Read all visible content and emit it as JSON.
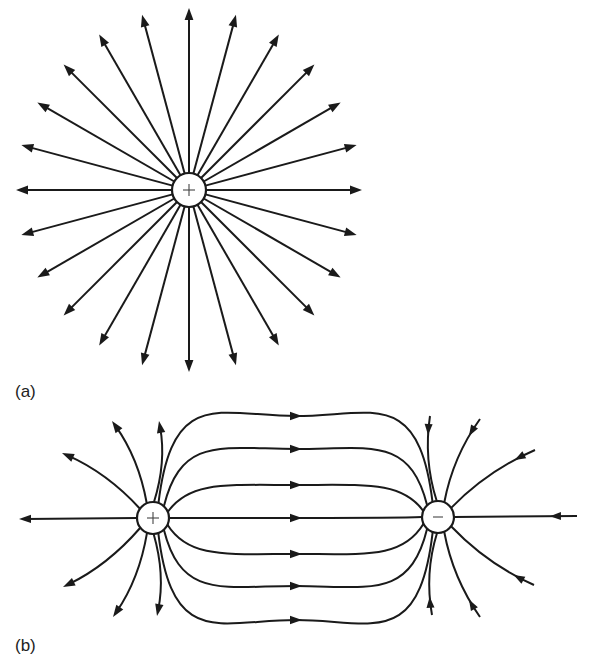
{
  "figure": {
    "background": "#ffffff",
    "stroke_color": "#1a1a1a",
    "panels": [
      {
        "id": "a",
        "label": "(a)",
        "title": "Field lines of an isolated positive point charge",
        "charge": {
          "sign": "+",
          "symbol": "+",
          "cx": 189,
          "cy": 190,
          "r": 17
        },
        "field_lines": {
          "count": 24,
          "direction": "outward",
          "extent_x": 173,
          "extent_y": 182
        }
      },
      {
        "id": "b",
        "label": "(b)",
        "title": "Field lines of an electric dipole (positive and negative charge)",
        "positive_charge": {
          "sign": "+",
          "symbol": "+",
          "cx": 153,
          "cy": 518,
          "r": 16
        },
        "negative_charge": {
          "sign": "-",
          "symbol": "–",
          "cx": 438,
          "cy": 517,
          "r": 16
        },
        "connecting_lines": {
          "count": 7,
          "direction": "positive-to-negative",
          "midpoint_x": 296,
          "midpoint_y": [
            416,
            449,
            485,
            518,
            554,
            586,
            620
          ]
        },
        "positive_outer_lines": [
          {
            "end": [
              19,
              519
            ]
          },
          {
            "end": [
              62,
              453
            ]
          },
          {
            "end": [
              112,
              421
            ]
          },
          {
            "end": [
              159,
              421
            ]
          },
          {
            "end": [
              63,
              587
            ]
          },
          {
            "end": [
              113,
              617
            ]
          },
          {
            "end": [
              157,
              616
            ]
          }
        ],
        "negative_outer_lines": [
          {
            "start": [
              430,
              416
            ]
          },
          {
            "start": [
              480,
              419
            ]
          },
          {
            "start": [
              535,
              450
            ]
          },
          {
            "start": [
              577,
              516
            ]
          },
          {
            "start": [
              534,
              585
            ]
          },
          {
            "start": [
              432,
              615
            ]
          },
          {
            "start": [
              480,
              617
            ]
          }
        ]
      }
    ]
  }
}
